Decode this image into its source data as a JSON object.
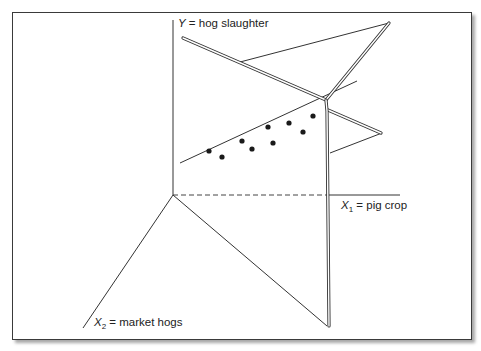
{
  "figure": {
    "type": "3d-regression-plane-diagram",
    "axes": {
      "y_label": {
        "var": "Y",
        "text": " = hog slaughter"
      },
      "x1_label": {
        "var": "X",
        "sub": "1",
        "text": " = pig crop"
      },
      "x2_label": {
        "var": "X",
        "sub": "2",
        "text": " = market hogs"
      }
    },
    "data_points_count": 9
  }
}
